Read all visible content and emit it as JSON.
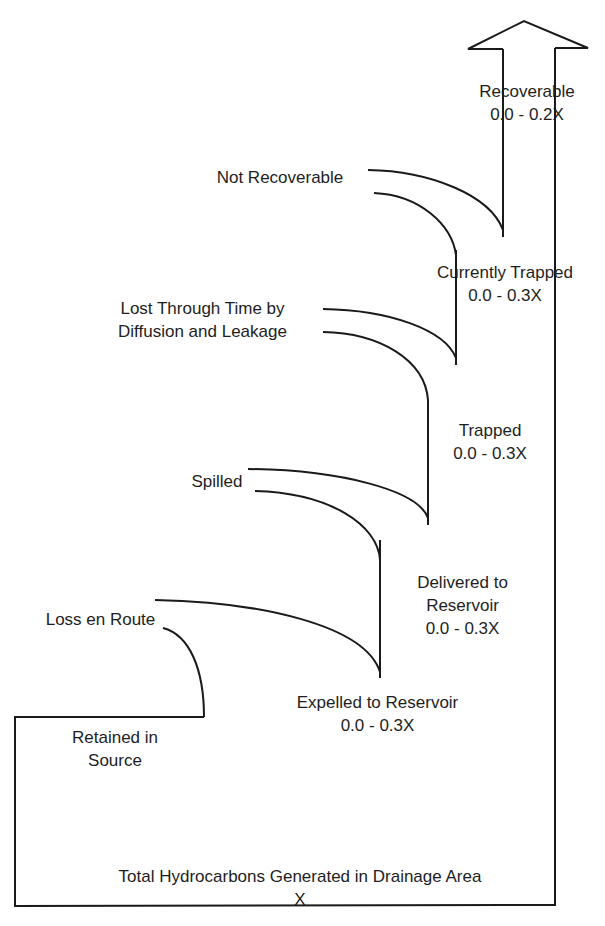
{
  "diagram": {
    "colors": {
      "stroke": "#1a1a1a",
      "text": "#1e1e1e",
      "background": "#ffffff"
    },
    "arrow": {
      "name": "up-arrow",
      "direction": "up"
    },
    "stages": [
      {
        "id": "total",
        "label": "Total Hydrocarbons Generated in Drainage Area",
        "value": "X"
      },
      {
        "id": "retained",
        "label_line1": "Retained in",
        "label_line2": "Source"
      },
      {
        "id": "loss-en-route",
        "label": "Loss en Route"
      },
      {
        "id": "expelled",
        "label": "Expelled to Reservoir",
        "value": "0.0 - 0.3X"
      },
      {
        "id": "delivered",
        "label_line1": "Delivered to",
        "label_line2": "Reservoir",
        "value": "0.0 - 0.3X"
      },
      {
        "id": "spilled",
        "label": "Spilled"
      },
      {
        "id": "trapped",
        "label": "Trapped",
        "value": "0.0 - 0.3X"
      },
      {
        "id": "lost-through-time",
        "label_line1": "Lost Through Time by",
        "label_line2": "Diffusion and Leakage"
      },
      {
        "id": "currently-trapped",
        "label": "Currently Trapped",
        "value": "0.0 - 0.3X"
      },
      {
        "id": "not-recoverable",
        "label": "Not Recoverable"
      },
      {
        "id": "recoverable",
        "label": "Recoverable",
        "value": "0.0 - 0.2X"
      }
    ]
  }
}
